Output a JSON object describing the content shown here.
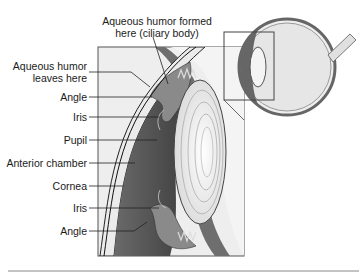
{
  "diagram": {
    "labels": {
      "formed_line1": "Aqueous humor formed",
      "formed_line2": "here (ciliary body)",
      "leaves_line1": "Aqueous humor",
      "leaves_line2": "leaves here",
      "angle_top": "Angle",
      "iris_top": "Iris",
      "pupil": "Pupil",
      "anterior_chamber": "Anterior chamber",
      "cornea": "Cornea",
      "iris_bottom": "Iris",
      "angle_bottom": "Angle"
    },
    "colors": {
      "line": "#333333",
      "box_fill": "#eeeeee",
      "chamber": "#555555",
      "iris": "#777777",
      "lens": "#f2f2f2",
      "cornea": "#e8e8e8"
    }
  }
}
